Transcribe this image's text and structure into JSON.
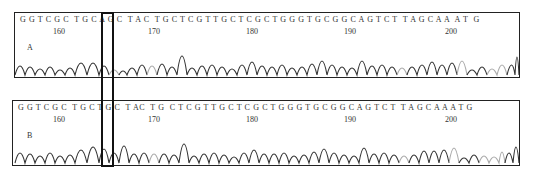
{
  "panels": [
    {
      "label": "A",
      "sequence": "G G T C G C  T G C A G C  T A C  T G C T C G T T G C T C G C T G G G T G C G G C A G T C T  T A G C A A  A T  G",
      "ticks": [
        {
          "label": "160",
          "x": 52
        },
        {
          "label": "170",
          "x": 130
        },
        {
          "label": "180",
          "x": 233
        },
        {
          "label": "190",
          "x": 332
        },
        {
          "label": "200",
          "x": 432
        }
      ],
      "variant_base": "A"
    },
    {
      "label": "B",
      "sequence": "G G T C G C  T G C T G C  T AC  T G  C T C G T T G C T C G C T G G G T G C G G C A G T C T  T A G C A A A T G",
      "ticks": [
        {
          "label": "160",
          "x": 52
        },
        {
          "label": "170",
          "x": 130
        },
        {
          "label": "180",
          "x": 233
        },
        {
          "label": "190",
          "x": 332
        },
        {
          "label": "200",
          "x": 432
        }
      ],
      "variant_base": "T"
    }
  ],
  "highlight": {
    "position": 10,
    "description": "Sequencing variant site A→T"
  },
  "colors": {
    "trace_dark": "#333333",
    "trace_light": "#aaaaaa",
    "border": "#222222"
  }
}
